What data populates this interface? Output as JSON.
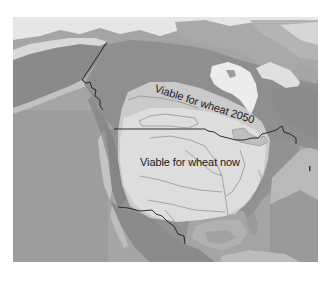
{
  "map": {
    "title": "",
    "region": "North America",
    "style": "grayscale shaded relief",
    "labels": {
      "viable_2050": "Viable for wheat 2050",
      "viable_now": "Viable for wheat now"
    },
    "zones": [
      {
        "name": "viable_now",
        "color": "#dcdcdc"
      },
      {
        "name": "viable_2050",
        "color": "#c9c9c9"
      }
    ],
    "colors": {
      "ocean": "#a3a3a3",
      "deep_ocean": "#959595",
      "land": "#8e8e8e",
      "ice_snow": "#ececec",
      "borders": "#1c1c1c",
      "rivers": "#7a7a7a"
    }
  }
}
